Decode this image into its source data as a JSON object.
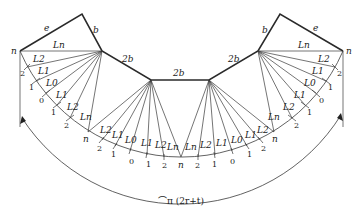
{
  "diagram": {
    "edge_labels": {
      "left_e": "e",
      "left_b": "b",
      "left_2b": "2b",
      "center_2b": "2b",
      "right_2b": "2b",
      "right_b": "b",
      "right_e": "e"
    },
    "vertex_labels": {
      "left_n": "n",
      "right_n": "n"
    },
    "left_outer_fan": {
      "line_labels": [
        "Ln",
        "L2",
        "L1",
        "L0",
        "L1",
        "L2",
        "Ln"
      ],
      "tick_labels": [
        "2",
        "1",
        "0",
        "1",
        "2",
        "n"
      ]
    },
    "left_inner_fan": {
      "line_labels": [
        "L2",
        "L1",
        "L0",
        "L1",
        "L2",
        "Ln"
      ],
      "tick_labels": [
        "2",
        "1",
        "0",
        "1",
        "2",
        "n"
      ]
    },
    "right_inner_fan": {
      "line_labels": [
        "Ln",
        "L2",
        "L1",
        "L0",
        "L1",
        "L2"
      ],
      "tick_labels": [
        "2",
        "1",
        "0",
        "1",
        "2",
        "n"
      ]
    },
    "right_outer_fan": {
      "line_labels": [
        "Ln",
        "L2",
        "L1",
        "L0",
        "L1",
        "L2",
        "Ln"
      ],
      "tick_labels": [
        "2",
        "1",
        "0",
        "1",
        "2"
      ]
    },
    "dimension_label": "⌒π (2r+t)"
  }
}
